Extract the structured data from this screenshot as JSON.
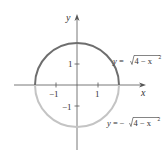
{
  "figure": {
    "axes": {
      "x_label": "x",
      "y_label": "y",
      "x_ticks": [
        "−1",
        "1"
      ],
      "y_ticks": [
        "1",
        "−1"
      ]
    },
    "curves": {
      "upper": {
        "equation_prefix": "y = ",
        "radicand": "4 − x",
        "exponent": "2",
        "color": "#6e6e6e"
      },
      "lower": {
        "equation_prefix": "y = −",
        "radicand": "4 − x",
        "exponent": "2",
        "color": "#c4c4c4"
      }
    },
    "axis_color": "#555555"
  }
}
